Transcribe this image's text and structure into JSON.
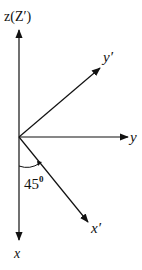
{
  "diagram": {
    "type": "coordinate-axes-rotation",
    "stroke_color": "#111111",
    "background": "#ffffff",
    "origin": [
      19,
      137
    ],
    "axes": [
      {
        "id": "z",
        "label": "z(Z′)",
        "direction": "up",
        "end": [
          19,
          28
        ]
      },
      {
        "id": "x",
        "label": "x",
        "direction": "down",
        "end": [
          19,
          242
        ]
      },
      {
        "id": "y",
        "label": "y",
        "direction": "right",
        "end": [
          129,
          137
        ]
      },
      {
        "id": "y_prime",
        "label": "y′",
        "direction": "up-right 45deg",
        "end": [
          101,
          67
        ]
      },
      {
        "id": "x_prime",
        "label": "x′",
        "direction": "down-right 45deg from x",
        "end": [
          89,
          223
        ]
      }
    ],
    "angle": {
      "label": "45",
      "superscript": "0",
      "between": [
        "x",
        "x_prime"
      ]
    }
  }
}
